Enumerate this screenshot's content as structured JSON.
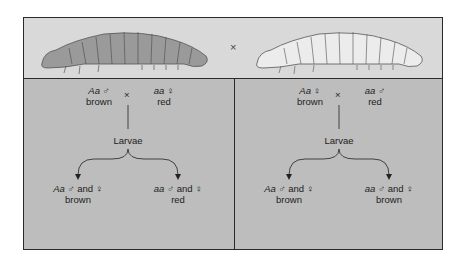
{
  "top": {
    "cross_symbol": "×",
    "left_larva": "brown larva illustration",
    "right_larva": "red (pale) larva illustration"
  },
  "panels": [
    {
      "parent1": {
        "genotype": "Aa",
        "sex": "♂",
        "phenotype": "brown"
      },
      "cross": "×",
      "parent2": {
        "genotype": "aa",
        "sex": "♀",
        "phenotype": "red"
      },
      "offspring_label": "Larvae",
      "offspring": [
        {
          "genotype": "Aa",
          "sexes": "♂ and ♀",
          "phenotype": "brown"
        },
        {
          "genotype": "aa",
          "sexes": "♂ and ♀",
          "phenotype": "red"
        }
      ]
    },
    {
      "parent1": {
        "genotype": "Aa",
        "sex": "♀",
        "phenotype": "brown"
      },
      "cross": "×",
      "parent2": {
        "genotype": "aa",
        "sex": "♂",
        "phenotype": "red"
      },
      "offspring_label": "Larvae",
      "offspring": [
        {
          "genotype": "Aa",
          "sexes": "♂ and ♀",
          "phenotype": "brown"
        },
        {
          "genotype": "aa",
          "sexes": "♂ and ♀",
          "phenotype": "brown"
        }
      ]
    }
  ],
  "colors": {
    "top_band": "#d9d9d9",
    "panel": "#bdbdbd",
    "border": "#2a2a2a"
  }
}
